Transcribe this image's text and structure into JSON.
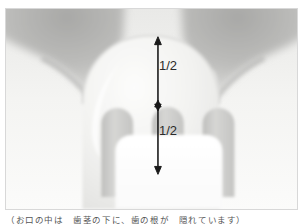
{
  "figure": {
    "kind": "dental-radiograph-illustration",
    "frame_border_color": "#d8d8d8",
    "background_color": "#ffffff"
  },
  "annotations": {
    "upper_segment_label": "1/2",
    "lower_segment_label": "1/2",
    "arrow_color": "#1a1a1a",
    "measurement_arrow": {
      "name": "crown-height-bisect-arrow",
      "top_y": 38,
      "mid_y": 104,
      "bottom_y": 170,
      "x": 158
    }
  },
  "anatomy": {
    "crown_fill": "#f2f2f0",
    "bone_fill": "#b9b9b7",
    "canal_fill": "#cfcfcd",
    "restoration_fill": "#ffffff",
    "parts": [
      "crown",
      "interdental-bone-left",
      "interdental-bone-right",
      "root-canal-left",
      "root-canal-center",
      "root-canal-right",
      "restoration"
    ]
  },
  "caption": {
    "text": "（お口の中は　歯茎の下に、歯の根が　隠れています）"
  }
}
